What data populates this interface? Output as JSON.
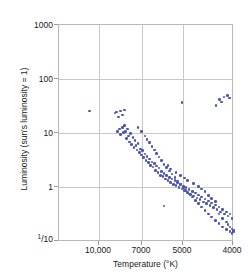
{
  "chart_data": {
    "type": "scatter",
    "title": "",
    "xlabel": "Temperature (°K)",
    "ylabel": "Luminosity (sun's luminosity = 1)",
    "x_tick_labels": [
      "10,000",
      "7000",
      "5000",
      "4000"
    ],
    "x_tick_values": [
      10000,
      7000,
      5000,
      4000
    ],
    "y_tick_labels": [
      "1000",
      "100",
      "10",
      "1",
      "1/10"
    ],
    "y_tick_values": [
      1000,
      100,
      10,
      1,
      0.1
    ],
    "xlim": [
      12000,
      4000
    ],
    "ylim": [
      0.1,
      1000
    ],
    "x_scale": "log-reversed",
    "y_scale": "log",
    "grid": true,
    "legend": null,
    "point_color": "#4a55b0",
    "series": [
      {
        "name": "stars",
        "points": [
          [
            9900,
            26
          ],
          [
            8450,
            24
          ],
          [
            8350,
            25
          ],
          [
            8250,
            20
          ],
          [
            8150,
            26
          ],
          [
            8050,
            22
          ],
          [
            7950,
            27
          ],
          [
            8300,
            11
          ],
          [
            8200,
            12
          ],
          [
            8150,
            9.5
          ],
          [
            8050,
            13
          ],
          [
            8000,
            10.5
          ],
          [
            7950,
            14
          ],
          [
            7900,
            11
          ],
          [
            7850,
            8.0
          ],
          [
            7800,
            12
          ],
          [
            7750,
            9.0
          ],
          [
            7700,
            7.0
          ],
          [
            7650,
            10
          ],
          [
            7600,
            6.2
          ],
          [
            7550,
            8.5
          ],
          [
            7500,
            5.5
          ],
          [
            7450,
            7.5
          ],
          [
            7400,
            6.0
          ],
          [
            7350,
            5.0
          ],
          [
            7300,
            6.5
          ],
          [
            7250,
            4.5
          ],
          [
            7200,
            5.2
          ],
          [
            7150,
            4.0
          ],
          [
            7100,
            4.8
          ],
          [
            7050,
            3.6
          ],
          [
            7000,
            4.2
          ],
          [
            6950,
            3.2
          ],
          [
            6900,
            3.8
          ],
          [
            6850,
            2.9
          ],
          [
            6800,
            3.4
          ],
          [
            6750,
            2.6
          ],
          [
            6700,
            3.0
          ],
          [
            6650,
            2.4
          ],
          [
            6600,
            2.8
          ],
          [
            6550,
            2.1
          ],
          [
            6500,
            2.5
          ],
          [
            6450,
            1.9
          ],
          [
            6400,
            2.3
          ],
          [
            6350,
            1.7
          ],
          [
            6300,
            2.0
          ],
          [
            6250,
            1.6
          ],
          [
            6200,
            1.85
          ],
          [
            6150,
            1.45
          ],
          [
            6100,
            1.7
          ],
          [
            6050,
            1.35
          ],
          [
            6000,
            1.55
          ],
          [
            5950,
            1.25
          ],
          [
            5900,
            1.45
          ],
          [
            5850,
            1.15
          ],
          [
            5800,
            1.35
          ],
          [
            5750,
            1.1
          ],
          [
            5700,
            1.25
          ],
          [
            5650,
            1.0
          ],
          [
            5600,
            1.15
          ],
          [
            5550,
            0.95
          ],
          [
            5500,
            1.05
          ],
          [
            5450,
            0.88
          ],
          [
            5400,
            1.0
          ],
          [
            5350,
            0.82
          ],
          [
            5300,
            0.92
          ],
          [
            5250,
            0.76
          ],
          [
            5200,
            0.86
          ],
          [
            5150,
            0.7
          ],
          [
            5100,
            0.8
          ],
          [
            5050,
            0.65
          ],
          [
            5000,
            0.74
          ],
          [
            4950,
            0.6
          ],
          [
            4900,
            0.68
          ],
          [
            4850,
            0.55
          ],
          [
            4800,
            0.62
          ],
          [
            4750,
            0.51
          ],
          [
            4700,
            0.57
          ],
          [
            4650,
            0.47
          ],
          [
            4600,
            0.52
          ],
          [
            4550,
            0.43
          ],
          [
            4500,
            0.48
          ],
          [
            4450,
            0.4
          ],
          [
            4400,
            0.44
          ],
          [
            4350,
            0.36
          ],
          [
            4300,
            0.4
          ],
          [
            4250,
            0.33
          ],
          [
            4200,
            0.36
          ],
          [
            4150,
            0.3
          ],
          [
            4100,
            0.33
          ],
          [
            4050,
            0.27
          ],
          [
            7300,
            13
          ],
          [
            7150,
            11
          ],
          [
            7000,
            9.0
          ],
          [
            6900,
            7.8
          ],
          [
            6800,
            6.8
          ],
          [
            6700,
            5.8
          ],
          [
            6600,
            5.0
          ],
          [
            6500,
            4.3
          ],
          [
            6400,
            3.7
          ],
          [
            6300,
            3.2
          ],
          [
            6200,
            2.7
          ],
          [
            6100,
            2.35
          ],
          [
            6000,
            2.05
          ],
          [
            5900,
            1.78
          ],
          [
            5800,
            1.55
          ],
          [
            5700,
            1.34
          ],
          [
            5600,
            1.17
          ],
          [
            5500,
            1.02
          ],
          [
            5400,
            0.89
          ],
          [
            5300,
            0.77
          ],
          [
            5200,
            0.67
          ],
          [
            5100,
            0.58
          ],
          [
            5000,
            0.51
          ],
          [
            4900,
            0.44
          ],
          [
            4800,
            0.38
          ],
          [
            4700,
            0.33
          ],
          [
            4600,
            0.29
          ],
          [
            4500,
            0.25
          ],
          [
            4400,
            0.22
          ],
          [
            4300,
            0.19
          ],
          [
            4200,
            0.17
          ],
          [
            4100,
            0.155
          ],
          [
            4050,
            0.145
          ],
          [
            6050,
            2.6
          ],
          [
            5950,
            2.2
          ],
          [
            5750,
            1.9
          ],
          [
            5600,
            1.7
          ],
          [
            5450,
            1.5
          ],
          [
            5350,
            1.35
          ],
          [
            5150,
            1.2
          ],
          [
            5000,
            1.05
          ],
          [
            4900,
            0.95
          ],
          [
            4800,
            0.85
          ],
          [
            4700,
            0.72
          ],
          [
            4600,
            0.63
          ],
          [
            4500,
            0.56
          ],
          [
            4400,
            0.33
          ],
          [
            4300,
            0.27
          ],
          [
            4200,
            0.235
          ],
          [
            4150,
            0.21
          ],
          [
            4100,
            0.19
          ],
          [
            4050,
            0.175
          ],
          [
            4020,
            0.165
          ],
          [
            4010,
            0.155
          ],
          [
            6200,
            0.46
          ],
          [
            5550,
            37
          ],
          [
            4480,
            33
          ],
          [
            4380,
            42
          ],
          [
            4330,
            38
          ],
          [
            4260,
            47
          ],
          [
            4160,
            50
          ],
          [
            4120,
            45
          ]
        ]
      }
    ]
  }
}
